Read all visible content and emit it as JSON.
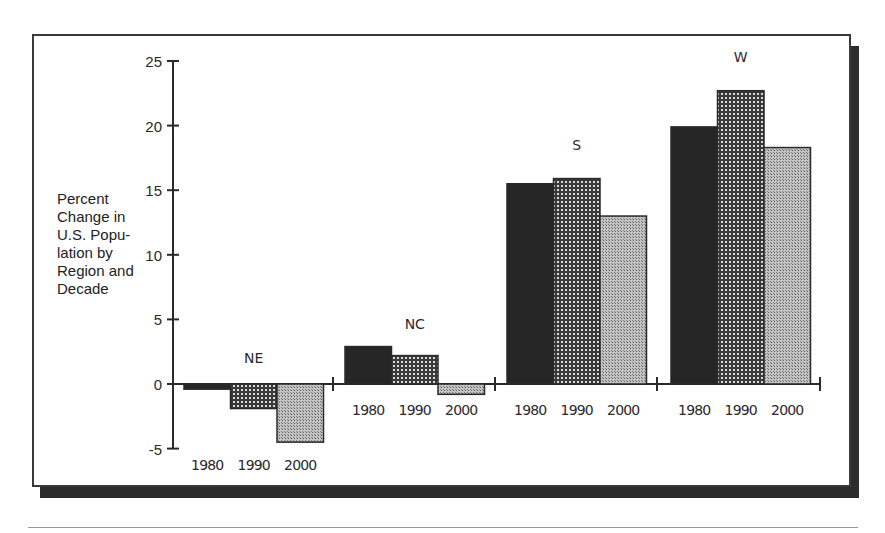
{
  "chart_data": {
    "type": "bar",
    "title": "",
    "ylabel": "Percent Change in U.S. Population by Region and Decade",
    "xlabel": "",
    "ylim": [
      -5,
      25
    ],
    "yticks": [
      -5,
      0,
      5,
      10,
      15,
      20,
      25
    ],
    "grid": false,
    "legend": null,
    "groups": [
      "NE",
      "NC",
      "S",
      "W"
    ],
    "categories": [
      "1980",
      "1990",
      "2000"
    ],
    "series": [
      {
        "name": "NE",
        "values": [
          -0.4,
          -1.9,
          -4.5
        ]
      },
      {
        "name": "NC",
        "values": [
          2.9,
          2.2,
          -0.8
        ]
      },
      {
        "name": "S",
        "values": [
          15.5,
          15.9,
          13.0
        ]
      },
      {
        "name": "W",
        "values": [
          19.9,
          22.7,
          18.3
        ]
      }
    ],
    "fills": {
      "1980": "#262626",
      "1990": "#6e6e6e",
      "2000": "#b0b0b0"
    }
  },
  "axis": {
    "ylabel_text": "Percent\nChange in\nU.S. Popu-\nlation by\nRegion and\nDecade",
    "ytick_labels": [
      "25",
      "20",
      "15",
      "10",
      "5",
      "0",
      "-5"
    ]
  },
  "groups": [
    {
      "label": "NE",
      "years": [
        "1980",
        "1990",
        "2000"
      ]
    },
    {
      "label": "NC",
      "years": [
        "1980",
        "1990",
        "2000"
      ]
    },
    {
      "label": "S",
      "years": [
        "1980",
        "1990",
        "2000"
      ]
    },
    {
      "label": "W",
      "years": [
        "1980",
        "1990",
        "2000"
      ]
    }
  ]
}
